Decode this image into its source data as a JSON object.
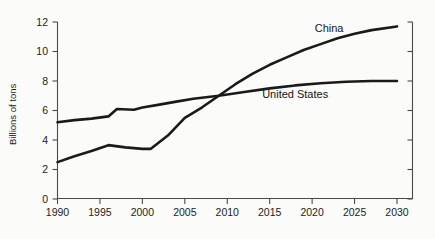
{
  "chart_data": {
    "type": "line",
    "title": "",
    "subtitle": "",
    "xlabel": "",
    "ylabel": "Billions of tons",
    "xlim": [
      1990,
      2030
    ],
    "ylim": [
      0,
      12
    ],
    "grid": false,
    "legend_position": "inline-annotations",
    "x_ticks": [
      "1990",
      "1995",
      "2000",
      "2005",
      "2010",
      "2015",
      "2020",
      "2025",
      "2030"
    ],
    "y_ticks": [
      "0",
      "2",
      "4",
      "6",
      "8",
      "10",
      "12"
    ],
    "annotations": [
      {
        "text": "China",
        "x": 2022,
        "y": 11.6
      },
      {
        "text": "United States",
        "x": 2018,
        "y": 7.1
      }
    ],
    "series": [
      {
        "name": "China",
        "x": [
          1990,
          1992,
          1994,
          1996,
          1998,
          2000,
          2001,
          2003,
          2005,
          2007,
          2009,
          2011,
          2013,
          2015,
          2017,
          2019,
          2021,
          2023,
          2025,
          2027,
          2030
        ],
        "values": [
          2.5,
          2.9,
          3.25,
          3.65,
          3.5,
          3.4,
          3.4,
          4.3,
          5.5,
          6.2,
          7.0,
          7.8,
          8.5,
          9.1,
          9.6,
          10.1,
          10.5,
          10.9,
          11.2,
          11.45,
          11.7
        ]
      },
      {
        "name": "United States",
        "x": [
          1990,
          1992,
          1994,
          1996,
          1997,
          1999,
          2000,
          2002,
          2004,
          2006,
          2009,
          2012,
          2015,
          2018,
          2021,
          2024,
          2027,
          2030
        ],
        "values": [
          5.2,
          5.35,
          5.45,
          5.6,
          6.1,
          6.05,
          6.2,
          6.4,
          6.6,
          6.8,
          7.0,
          7.25,
          7.5,
          7.7,
          7.85,
          7.95,
          8.0,
          8.0
        ]
      }
    ]
  },
  "axes": {
    "y_axis_label": "Billions of tons"
  }
}
